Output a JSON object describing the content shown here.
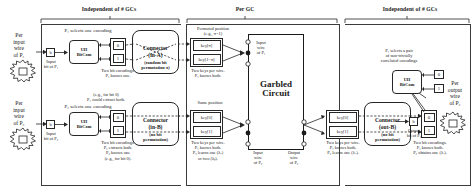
{
  "sections": {
    "left": "Independent of # GCs",
    "middle": "Per GC",
    "right": "Independent of # GCs"
  },
  "left_margin": {
    "p1_wire": "Per\ninput\nwire\nof P₁",
    "p2_wire": "Per\ninput\nwire\nof P₂"
  },
  "right_margin": {
    "p2_out_wire": "Per\noutput\nwire\nof P₂"
  },
  "row_a": {
    "caption": "P₁ selects one encoding",
    "input_bit_box": "b",
    "input_bit_label": "Input\nbit of P₁",
    "bitcom_box": "UH\nBitCom",
    "bit0": "0",
    "bit1": "1",
    "encodings_caption": "Two bit encodings.\nP₁ knows one.",
    "connector_title": "Connector",
    "connector_sub": "(in-A)",
    "connector_note": "(random bit\npermutation π)",
    "permuted_caption": "Permuted position\n(e.g., π=1)",
    "key_top": "key[π]",
    "key_bot": "key[1−π]",
    "keys_caption": "Two keys per wire.\nP₁ knows both.",
    "wire_label": "Input\nwire\nof P₁"
  },
  "row_b": {
    "caption": "P₂ selects one encoding",
    "input_bit_box": "b",
    "input_bit_label": "Input\nbit of P₂",
    "bitcom_box": "UH\nBitCom",
    "bit0": "0",
    "bit1": "1",
    "extract_note": "(e.g., for bit 0)\nP₁ could extract both.",
    "encodings_caption": "Two bit encodings.\nP₁ extracts both.\nP₂ knows one\n(e.g., for bit 0).",
    "connector_title": "Connector",
    "connector_sub": "(in-B)",
    "connector_note": "(no bit\npermutation)",
    "same_position": "Same position",
    "key_top": "key[0]",
    "key_bot": "key[1]",
    "keys_caption": "Two keys per wire.\nP₁ knows both.\nP₂ learns one (λᵥ)\nor two (λᵦ).",
    "wire_label_in": "Input\nwire\nof P₂",
    "wire_label_out": "Output\nwire\nof P₂"
  },
  "row_c": {
    "connector_title": "Connector",
    "connector_sub": "(out-B)",
    "connector_note": "(no bit\npermutation)",
    "key_top": "key[0]",
    "key_bot": "key[1]",
    "keys_caption": "Two keys per wire.\nP₁ knows both.\nP₂ learns one (λᵥ).",
    "bit0": "0",
    "bit1": "1",
    "encodings_caption": "Two bit encodings.\nP₁ knows both.\nP₂ obtains one (λᵥ).",
    "out_caption": "P₁ selects a pair\nof non-trivially\ncorrelated encodings",
    "bitcom_box": "UH\nBitCom",
    "out_bit0": "0",
    "out_bit1": "1",
    "output_bit_box": "b",
    "output_bit_label": "Output\nbit of P₂"
  },
  "garbled_circuit": {
    "line1": "Garbled",
    "line2": "Circuit"
  },
  "colors": {
    "stroke": "#262626",
    "background": "#ffffff"
  }
}
